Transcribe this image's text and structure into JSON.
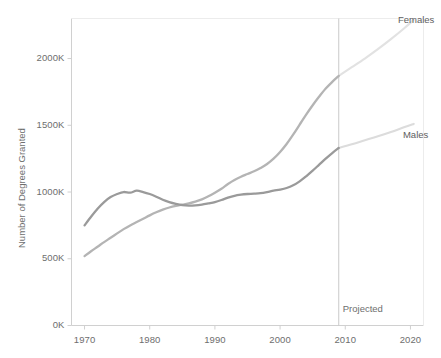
{
  "chart_data": {
    "type": "line",
    "title": "",
    "xlabel": "",
    "ylabel": "Number of Degrees Granted",
    "xlim": [
      1968,
      2022
    ],
    "ylim": [
      0,
      2300
    ],
    "grid": false,
    "legend_position": "right-inline",
    "x_ticks": [
      "1970",
      "1980",
      "1990",
      "2000",
      "2010",
      "2020"
    ],
    "x_tick_values": [
      1970,
      1980,
      1990,
      2000,
      2010,
      2020
    ],
    "y_ticks": [
      "0K",
      "500K",
      "1000K",
      "1500K",
      "2000K"
    ],
    "y_tick_values": [
      0,
      500,
      1000,
      1500,
      2000
    ],
    "units": "thousands of degrees",
    "annotations": [
      {
        "text": "Projected",
        "x": 2009,
        "y": 120,
        "name": "projected-annotation"
      }
    ],
    "divider": {
      "x": 2009,
      "label": "Projected"
    },
    "series": [
      {
        "name": "Females",
        "color": "#b4b4b4",
        "projected_color": "#e2e2e2",
        "label_x": 2019,
        "label_y": 2290,
        "x": [
          1970,
          1971,
          1972,
          1973,
          1974,
          1975,
          1976,
          1977,
          1978,
          1979,
          1980,
          1981,
          1982,
          1983,
          1984,
          1985,
          1986,
          1987,
          1988,
          1989,
          1990,
          1991,
          1992,
          1993,
          1994,
          1995,
          1996,
          1997,
          1998,
          1999,
          2000,
          2001,
          2002,
          2003,
          2004,
          2005,
          2006,
          2007,
          2008,
          2009
        ],
        "values": [
          520,
          556,
          590,
          625,
          657,
          690,
          722,
          750,
          775,
          800,
          825,
          848,
          868,
          884,
          896,
          905,
          915,
          928,
          945,
          968,
          995,
          1025,
          1060,
          1090,
          1115,
          1135,
          1155,
          1180,
          1210,
          1250,
          1300,
          1360,
          1430,
          1505,
          1580,
          1650,
          1715,
          1775,
          1825,
          1870
        ]
      },
      {
        "name": "Males",
        "color": "#9a9a9a",
        "projected_color": "#dcdcdc",
        "label_x": 2019,
        "label_y": 1430,
        "x": [
          1970,
          1971,
          1972,
          1973,
          1974,
          1975,
          1976,
          1977,
          1978,
          1979,
          1980,
          1981,
          1982,
          1983,
          1984,
          1985,
          1986,
          1987,
          1988,
          1989,
          1990,
          1991,
          1992,
          1993,
          1994,
          1995,
          1996,
          1997,
          1998,
          1999,
          2000,
          2001,
          2002,
          2003,
          2004,
          2005,
          2006,
          2007,
          2008,
          2009
        ],
        "values": [
          750,
          815,
          875,
          925,
          962,
          985,
          1000,
          995,
          1010,
          1000,
          985,
          965,
          942,
          925,
          912,
          902,
          898,
          900,
          906,
          915,
          925,
          940,
          958,
          972,
          980,
          985,
          988,
          992,
          1000,
          1010,
          1018,
          1030,
          1050,
          1080,
          1118,
          1160,
          1205,
          1250,
          1292,
          1330
        ]
      }
    ],
    "projected_series": [
      {
        "name": "Females",
        "x": [
          2009,
          2011,
          2013,
          2015,
          2017,
          2019,
          2020.5
        ],
        "values": [
          1870,
          1935,
          2000,
          2070,
          2145,
          2225,
          2290
        ]
      },
      {
        "name": "Males",
        "x": [
          2009,
          2011,
          2013,
          2015,
          2017,
          2019,
          2020.5
        ],
        "values": [
          1330,
          1358,
          1388,
          1418,
          1450,
          1485,
          1510
        ]
      }
    ]
  },
  "labels": {
    "females": "Females",
    "males": "Males",
    "projected": "Projected",
    "y_axis_title": "Number of Degrees Granted"
  },
  "colors": {
    "males_line": "#9a9a9a",
    "females_line": "#b4b4b4",
    "males_projected": "#dcdcdc",
    "females_projected": "#e2e2e2",
    "axis": "#d0d0d0",
    "divider": "#c9c9c9",
    "text": "#6e6e6e"
  }
}
